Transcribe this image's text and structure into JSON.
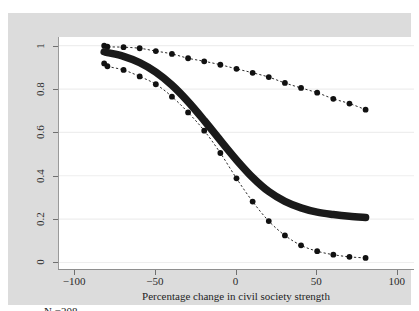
{
  "figure": {
    "background_color": "#dcdcdc",
    "panel_color": "#ffffff",
    "top_artifact_text": "                                                                         "
  },
  "annotation": {
    "n_label": "N =208"
  },
  "chart_data": {
    "type": "line",
    "title": "",
    "subtitle": "",
    "xlabel": "Percentage change in civil society strength",
    "ylabel": "",
    "xlim": [
      -110,
      110
    ],
    "ylim": [
      -0.03,
      1.04
    ],
    "xticks": [
      -100,
      -50,
      0,
      50,
      100
    ],
    "xticklabels": [
      "-100",
      "-50",
      "0",
      "50",
      "100"
    ],
    "yticks": [
      0,
      0.2,
      0.4,
      0.6,
      0.8,
      1
    ],
    "yticklabels": [
      "0",
      "0.2",
      "0.4",
      "0.6",
      "0.8",
      "1"
    ],
    "grid": "horizontal",
    "grid_color": "#eeeeee",
    "legend": "none",
    "legend_position": "none",
    "x": [
      -82,
      -80,
      -70,
      -60,
      -50,
      -40,
      -30,
      -20,
      -10,
      0,
      10,
      20,
      30,
      40,
      50,
      60,
      70,
      80
    ],
    "series": [
      {
        "name": "upper-confidence-bound",
        "style": "dotted-with-markers",
        "color": "#111111",
        "marker": "circle",
        "values": [
          1.0,
          0.995,
          0.993,
          0.988,
          0.975,
          0.962,
          0.942,
          0.928,
          0.912,
          0.893,
          0.875,
          0.855,
          0.828,
          0.805,
          0.783,
          0.755,
          0.733,
          0.705
        ]
      },
      {
        "name": "point-estimate",
        "style": "thick-band",
        "color": "#1a1a1a",
        "marker": "none",
        "values": [
          0.972,
          0.968,
          0.951,
          0.922,
          0.878,
          0.818,
          0.742,
          0.655,
          0.563,
          0.473,
          0.392,
          0.327,
          0.282,
          0.252,
          0.232,
          0.221,
          0.213,
          0.208
        ]
      },
      {
        "name": "lower-confidence-bound",
        "style": "dotted-with-markers",
        "color": "#111111",
        "marker": "circle",
        "values": [
          0.918,
          0.905,
          0.888,
          0.858,
          0.822,
          0.765,
          0.692,
          0.608,
          0.505,
          0.388,
          0.281,
          0.191,
          0.125,
          0.079,
          0.052,
          0.036,
          0.026,
          0.021
        ]
      }
    ]
  }
}
